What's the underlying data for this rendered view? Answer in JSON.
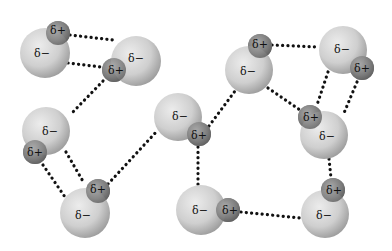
{
  "labels": {
    "positive": "δ+",
    "negative": "δ−"
  },
  "colors": {
    "oxygen_light": "#e4e4e4",
    "oxygen_dark": "#9a9a9a",
    "hydrogen_light": "#a8a8a8",
    "hydrogen_dark": "#5e5e5e",
    "bond": "#111111",
    "background": "#ffffff"
  },
  "molecules": [
    {
      "id": "m1",
      "oxygen": {
        "cx": 45,
        "cy": 53,
        "r": 25
      },
      "hydrogen": {
        "cx": 58,
        "cy": 33,
        "r": 12
      },
      "neg_label": {
        "x": 42,
        "y": 53
      },
      "pos_label": {
        "x": 58,
        "y": 30
      }
    },
    {
      "id": "m2",
      "oxygen": {
        "cx": 136,
        "cy": 61,
        "r": 25
      },
      "hydrogen": {
        "cx": 114,
        "cy": 70,
        "r": 12
      },
      "neg_label": {
        "x": 136,
        "y": 58
      },
      "pos_label": {
        "x": 116,
        "y": 70
      }
    },
    {
      "id": "m3",
      "oxygen": {
        "cx": 46,
        "cy": 131,
        "r": 24
      },
      "hydrogen": {
        "cx": 35,
        "cy": 152,
        "r": 12
      },
      "neg_label": {
        "x": 50,
        "y": 131
      },
      "pos_label": {
        "x": 35,
        "y": 152
      }
    },
    {
      "id": "m4",
      "oxygen": {
        "cx": 85,
        "cy": 213,
        "r": 25
      },
      "hydrogen": {
        "cx": 98,
        "cy": 191,
        "r": 12
      },
      "neg_label": {
        "x": 83,
        "y": 215
      },
      "pos_label": {
        "x": 98,
        "y": 189
      }
    },
    {
      "id": "m5",
      "oxygen": {
        "cx": 178,
        "cy": 117,
        "r": 24
      },
      "hydrogen": {
        "cx": 199,
        "cy": 134,
        "r": 12
      },
      "neg_label": {
        "x": 180,
        "y": 116
      },
      "pos_label": {
        "x": 199,
        "y": 135
      }
    },
    {
      "id": "m6",
      "oxygen": {
        "cx": 249,
        "cy": 70,
        "r": 24
      },
      "hydrogen": {
        "cx": 260,
        "cy": 46,
        "r": 12
      },
      "neg_label": {
        "x": 248,
        "y": 71
      },
      "pos_label": {
        "x": 260,
        "y": 44
      }
    },
    {
      "id": "m7",
      "oxygen": {
        "cx": 343,
        "cy": 50,
        "r": 24
      },
      "hydrogen": {
        "cx": 362,
        "cy": 68,
        "r": 12
      },
      "neg_label": {
        "x": 342,
        "y": 49
      },
      "pos_label": {
        "x": 362,
        "y": 68
      }
    },
    {
      "id": "m8",
      "oxygen": {
        "cx": 324,
        "cy": 135,
        "r": 24
      },
      "hydrogen": {
        "cx": 310,
        "cy": 117,
        "r": 12
      },
      "neg_label": {
        "x": 327,
        "y": 136
      },
      "pos_label": {
        "x": 311,
        "y": 117
      }
    },
    {
      "id": "m9",
      "oxygen": {
        "cx": 201,
        "cy": 210,
        "r": 25
      },
      "hydrogen": {
        "cx": 228,
        "cy": 210,
        "r": 12
      },
      "neg_label": {
        "x": 200,
        "y": 210
      },
      "pos_label": {
        "x": 230,
        "y": 210
      }
    },
    {
      "id": "m10",
      "oxygen": {
        "cx": 325,
        "cy": 214,
        "r": 24
      },
      "hydrogen": {
        "cx": 333,
        "cy": 190,
        "r": 12
      },
      "neg_label": {
        "x": 324,
        "y": 215
      },
      "pos_label": {
        "x": 334,
        "y": 190
      }
    }
  ],
  "hydrogen_bonds": [
    {
      "from": "m1-H",
      "to": "m2-O",
      "x1": 70,
      "y1": 35,
      "x2": 113,
      "y2": 40
    },
    {
      "from": "m1-O",
      "to": "m2-H",
      "x1": 68,
      "y1": 63,
      "x2": 101,
      "y2": 67
    },
    {
      "from": "m2-H",
      "to": "m3-O",
      "x1": 103,
      "y1": 81,
      "x2": 70,
      "y2": 115
    },
    {
      "from": "m3-O",
      "to": "m4-H",
      "x1": 66,
      "y1": 152,
      "x2": 84,
      "y2": 183
    },
    {
      "from": "m3-H",
      "to": "m4-O",
      "x1": 43,
      "y1": 165,
      "x2": 65,
      "y2": 197
    },
    {
      "from": "m4-H",
      "to": "m5-O",
      "x1": 108,
      "y1": 184,
      "x2": 157,
      "y2": 131
    },
    {
      "from": "m5-H",
      "to": "m9-O",
      "x1": 198,
      "y1": 147,
      "x2": 198,
      "y2": 185
    },
    {
      "from": "m5-H",
      "to": "m6-O",
      "x1": 209,
      "y1": 126,
      "x2": 235,
      "y2": 91
    },
    {
      "from": "m6-H",
      "to": "m7-O",
      "x1": 272,
      "y1": 45,
      "x2": 319,
      "y2": 47
    },
    {
      "from": "m6-O",
      "to": "m8-H",
      "x1": 268,
      "y1": 88,
      "x2": 300,
      "y2": 110
    },
    {
      "from": "m7-O",
      "to": "m8-H",
      "x1": 328,
      "y1": 72,
      "x2": 317,
      "y2": 105
    },
    {
      "from": "m7-H",
      "to": "m8-O",
      "x1": 357,
      "y1": 82,
      "x2": 344,
      "y2": 113
    },
    {
      "from": "m8-O",
      "to": "m10-H",
      "x1": 329,
      "y1": 159,
      "x2": 331,
      "y2": 178
    },
    {
      "from": "m9-H",
      "to": "m10-O",
      "x1": 241,
      "y1": 212,
      "x2": 300,
      "y2": 218
    }
  ]
}
